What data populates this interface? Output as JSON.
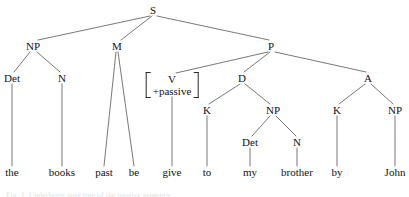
{
  "figure": {
    "sentence": "the books past be give to my brother by John",
    "caption": "Fig. 1. Underlying structure of the passive sentence",
    "line_color": "#555555",
    "text_color": "#111111",
    "background": "#ffffff"
  },
  "nodes": [
    {
      "id": "S",
      "label": "S",
      "x": 153,
      "y": 10,
      "kind": "category"
    },
    {
      "id": "NP1",
      "label": "NP",
      "x": 33,
      "y": 46,
      "kind": "category"
    },
    {
      "id": "M",
      "label": "M",
      "x": 117,
      "y": 46,
      "kind": "category"
    },
    {
      "id": "P",
      "label": "P",
      "x": 271,
      "y": 46,
      "kind": "category"
    },
    {
      "id": "Det1",
      "label": "Det",
      "x": 12,
      "y": 78,
      "kind": "category"
    },
    {
      "id": "N1",
      "label": "N",
      "x": 62,
      "y": 78,
      "kind": "category"
    },
    {
      "id": "D",
      "label": "D",
      "x": 242,
      "y": 78,
      "kind": "category"
    },
    {
      "id": "A",
      "label": "A",
      "x": 368,
      "y": 78,
      "kind": "category"
    },
    {
      "id": "K1",
      "label": "K",
      "x": 207,
      "y": 110,
      "kind": "category"
    },
    {
      "id": "NP2",
      "label": "NP",
      "x": 273,
      "y": 110,
      "kind": "category"
    },
    {
      "id": "K2",
      "label": "K",
      "x": 337,
      "y": 110,
      "kind": "category"
    },
    {
      "id": "NP3",
      "label": "NP",
      "x": 395,
      "y": 110,
      "kind": "category"
    },
    {
      "id": "Det2",
      "label": "Det",
      "x": 250,
      "y": 142,
      "kind": "category"
    },
    {
      "id": "N2",
      "label": "N",
      "x": 297,
      "y": 142,
      "kind": "category"
    }
  ],
  "matrix_node": {
    "id": "V",
    "x": 172,
    "y": 85,
    "rows": [
      "V",
      "+passive"
    ],
    "left_bracket": "[",
    "right_bracket": "]"
  },
  "terminals": [
    {
      "id": "t-the",
      "label": "the",
      "x": 12,
      "y": 172,
      "parent": "Det1"
    },
    {
      "id": "t-books",
      "label": "books",
      "x": 62,
      "y": 172,
      "parent": "N1"
    },
    {
      "id": "t-past",
      "label": "past",
      "x": 104,
      "y": 172,
      "parent": "M"
    },
    {
      "id": "t-be",
      "label": "be",
      "x": 134,
      "y": 172,
      "parent": "M"
    },
    {
      "id": "t-give",
      "label": "give",
      "x": 172,
      "y": 172,
      "parent": "V"
    },
    {
      "id": "t-to",
      "label": "to",
      "x": 207,
      "y": 172,
      "parent": "K1"
    },
    {
      "id": "t-my",
      "label": "my",
      "x": 250,
      "y": 172,
      "parent": "Det2"
    },
    {
      "id": "t-brother",
      "label": "brother",
      "x": 297,
      "y": 172,
      "parent": "N2"
    },
    {
      "id": "t-by",
      "label": "by",
      "x": 337,
      "y": 172,
      "parent": "K2"
    },
    {
      "id": "t-John",
      "label": "John",
      "x": 395,
      "y": 172,
      "parent": "NP3"
    }
  ],
  "edges": [
    {
      "from": "S",
      "to": "NP1",
      "x1": 150,
      "y1": 16,
      "x2": 38,
      "y2": 40
    },
    {
      "from": "S",
      "to": "M",
      "x1": 152,
      "y1": 16,
      "x2": 121,
      "y2": 40
    },
    {
      "from": "S",
      "to": "P",
      "x1": 157,
      "y1": 16,
      "x2": 269,
      "y2": 40
    },
    {
      "from": "NP1",
      "to": "Det1",
      "x1": 30,
      "y1": 52,
      "x2": 14,
      "y2": 72
    },
    {
      "from": "NP1",
      "to": "N1",
      "x1": 37,
      "y1": 52,
      "x2": 60,
      "y2": 72
    },
    {
      "from": "M",
      "to": "past",
      "x1": 116,
      "y1": 52,
      "x2": 104,
      "y2": 166
    },
    {
      "from": "M",
      "to": "be",
      "x1": 118,
      "y1": 52,
      "x2": 134,
      "y2": 166
    },
    {
      "from": "P",
      "to": "V",
      "x1": 268,
      "y1": 52,
      "x2": 176,
      "y2": 73
    },
    {
      "from": "P",
      "to": "D",
      "x1": 270,
      "y1": 52,
      "x2": 244,
      "y2": 72
    },
    {
      "from": "P",
      "to": "A",
      "x1": 275,
      "y1": 52,
      "x2": 366,
      "y2": 72
    },
    {
      "from": "V",
      "to": "give",
      "x1": 172,
      "y1": 97,
      "x2": 172,
      "y2": 166
    },
    {
      "from": "D",
      "to": "K1",
      "x1": 240,
      "y1": 84,
      "x2": 209,
      "y2": 104
    },
    {
      "from": "D",
      "to": "NP2",
      "x1": 245,
      "y1": 84,
      "x2": 270,
      "y2": 104
    },
    {
      "from": "A",
      "to": "K2",
      "x1": 365,
      "y1": 84,
      "x2": 339,
      "y2": 104
    },
    {
      "from": "A",
      "to": "NP3",
      "x1": 371,
      "y1": 84,
      "x2": 393,
      "y2": 104
    },
    {
      "from": "K1",
      "to": "to",
      "x1": 207,
      "y1": 116,
      "x2": 207,
      "y2": 166
    },
    {
      "from": "NP2",
      "to": "Det2",
      "x1": 270,
      "y1": 116,
      "x2": 252,
      "y2": 136
    },
    {
      "from": "NP2",
      "to": "N2",
      "x1": 276,
      "y1": 116,
      "x2": 296,
      "y2": 136
    },
    {
      "from": "Det2",
      "to": "my",
      "x1": 250,
      "y1": 148,
      "x2": 250,
      "y2": 166
    },
    {
      "from": "N2",
      "to": "brother",
      "x1": 297,
      "y1": 148,
      "x2": 297,
      "y2": 166
    },
    {
      "from": "K2",
      "to": "by",
      "x1": 337,
      "y1": 116,
      "x2": 337,
      "y2": 166
    },
    {
      "from": "NP3",
      "to": "John",
      "x1": 395,
      "y1": 116,
      "x2": 395,
      "y2": 166
    },
    {
      "from": "Det1",
      "to": "the",
      "x1": 12,
      "y1": 84,
      "x2": 12,
      "y2": 166
    },
    {
      "from": "N1",
      "to": "books",
      "x1": 62,
      "y1": 84,
      "x2": 62,
      "y2": 166
    }
  ]
}
